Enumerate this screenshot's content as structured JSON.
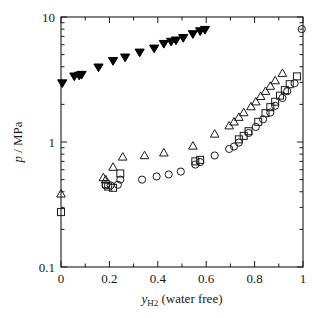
{
  "chart_data": {
    "type": "scatter",
    "title": "",
    "xlabel": "y_H2 (water free)",
    "xlabel_parts": {
      "sym": "y",
      "subscript": "H2",
      "rest": "(water free)"
    },
    "ylabel": "p / MPa",
    "ylabel_parts": {
      "sym": "p",
      "rest": "/ MPa"
    },
    "xlim": [
      0,
      1
    ],
    "ylim": [
      0.1,
      10
    ],
    "yscale": "log",
    "xscale": "linear",
    "grid": false,
    "legend": "none",
    "xticks": [
      0,
      0.2,
      0.4,
      0.6,
      0.8,
      1
    ],
    "xticklabels": [
      "0",
      "0.2",
      "0.4",
      "0.6",
      "0.8",
      "1"
    ],
    "xminor_count": 1,
    "yticks": [
      0.1,
      1,
      10
    ],
    "yticklabels": [
      "0.1",
      "1",
      "10"
    ],
    "series": [
      {
        "name": "filled-down-triangle",
        "marker": "triangle-down",
        "fill": "#000000",
        "points": [
          [
            0.005,
            2.95
          ],
          [
            0.055,
            3.35
          ],
          [
            0.075,
            3.4
          ],
          [
            0.085,
            3.45
          ],
          [
            0.155,
            3.95
          ],
          [
            0.215,
            4.45
          ],
          [
            0.265,
            4.75
          ],
          [
            0.325,
            5.2
          ],
          [
            0.385,
            5.6
          ],
          [
            0.425,
            6.1
          ],
          [
            0.455,
            6.35
          ],
          [
            0.475,
            6.5
          ],
          [
            0.505,
            6.8
          ],
          [
            0.545,
            7.3
          ],
          [
            0.575,
            7.7
          ],
          [
            0.595,
            7.9
          ]
        ]
      },
      {
        "name": "open-circle",
        "marker": "circle",
        "fill": "none",
        "points": [
          [
            0.185,
            0.45
          ],
          [
            0.205,
            0.45
          ],
          [
            0.235,
            0.455
          ],
          [
            0.245,
            0.5
          ],
          [
            0.335,
            0.5
          ],
          [
            0.395,
            0.53
          ],
          [
            0.445,
            0.55
          ],
          [
            0.495,
            0.58
          ],
          [
            0.555,
            0.66
          ],
          [
            0.575,
            0.69
          ],
          [
            0.635,
            0.78
          ],
          [
            0.695,
            0.88
          ],
          [
            0.715,
            0.92
          ],
          [
            0.735,
            0.99
          ],
          [
            0.775,
            1.18
          ],
          [
            0.805,
            1.32
          ],
          [
            0.835,
            1.52
          ],
          [
            0.865,
            1.72
          ],
          [
            0.885,
            1.95
          ],
          [
            0.915,
            2.25
          ],
          [
            0.935,
            2.55
          ],
          [
            0.965,
            2.95
          ],
          [
            0.995,
            8.0
          ]
        ]
      },
      {
        "name": "open-square",
        "marker": "square",
        "fill": "none",
        "points": [
          [
            0.0,
            0.275
          ],
          [
            0.185,
            0.46
          ],
          [
            0.195,
            0.44
          ],
          [
            0.215,
            0.43
          ],
          [
            0.245,
            0.56
          ],
          [
            0.555,
            0.7
          ],
          [
            0.575,
            0.72
          ],
          [
            0.735,
            1.05
          ],
          [
            0.755,
            1.12
          ],
          [
            0.775,
            1.22
          ],
          [
            0.815,
            1.45
          ],
          [
            0.845,
            1.7
          ],
          [
            0.865,
            1.9
          ],
          [
            0.885,
            2.1
          ],
          [
            0.905,
            2.35
          ],
          [
            0.925,
            2.6
          ],
          [
            0.945,
            2.9
          ],
          [
            0.975,
            3.35
          ]
        ]
      },
      {
        "name": "open-up-triangle",
        "marker": "triangle-up",
        "fill": "none",
        "points": [
          [
            0.0,
            0.385
          ],
          [
            0.175,
            0.52
          ],
          [
            0.185,
            0.5
          ],
          [
            0.215,
            0.63
          ],
          [
            0.255,
            0.76
          ],
          [
            0.345,
            0.78
          ],
          [
            0.425,
            0.82
          ],
          [
            0.545,
            0.93
          ],
          [
            0.635,
            1.16
          ],
          [
            0.695,
            1.35
          ],
          [
            0.715,
            1.45
          ],
          [
            0.735,
            1.58
          ],
          [
            0.755,
            1.72
          ],
          [
            0.785,
            1.92
          ],
          [
            0.805,
            2.1
          ],
          [
            0.825,
            2.32
          ],
          [
            0.845,
            2.55
          ],
          [
            0.865,
            2.8
          ],
          [
            0.885,
            3.1
          ],
          [
            0.915,
            3.55
          ]
        ]
      }
    ]
  },
  "axes": {
    "left_px": 61,
    "right_px": 303,
    "top_px": 17,
    "bottom_px": 267
  }
}
